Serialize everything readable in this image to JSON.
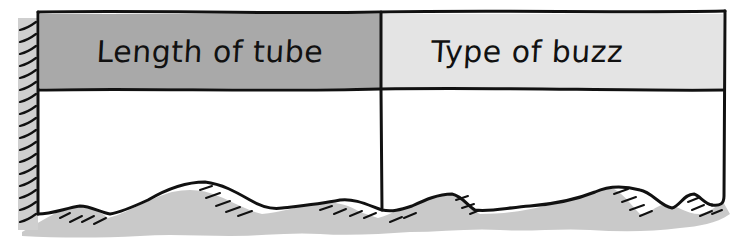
{
  "table": {
    "columns": [
      {
        "header": "Length of tube",
        "header_fill": "#a9a9a9"
      },
      {
        "header": "Type of buzz",
        "header_fill": "#e3e3e3"
      }
    ],
    "rows": []
  },
  "colors": {
    "ink": "#111111",
    "shadow": "#c8c8c8",
    "paper": "#ffffff"
  }
}
